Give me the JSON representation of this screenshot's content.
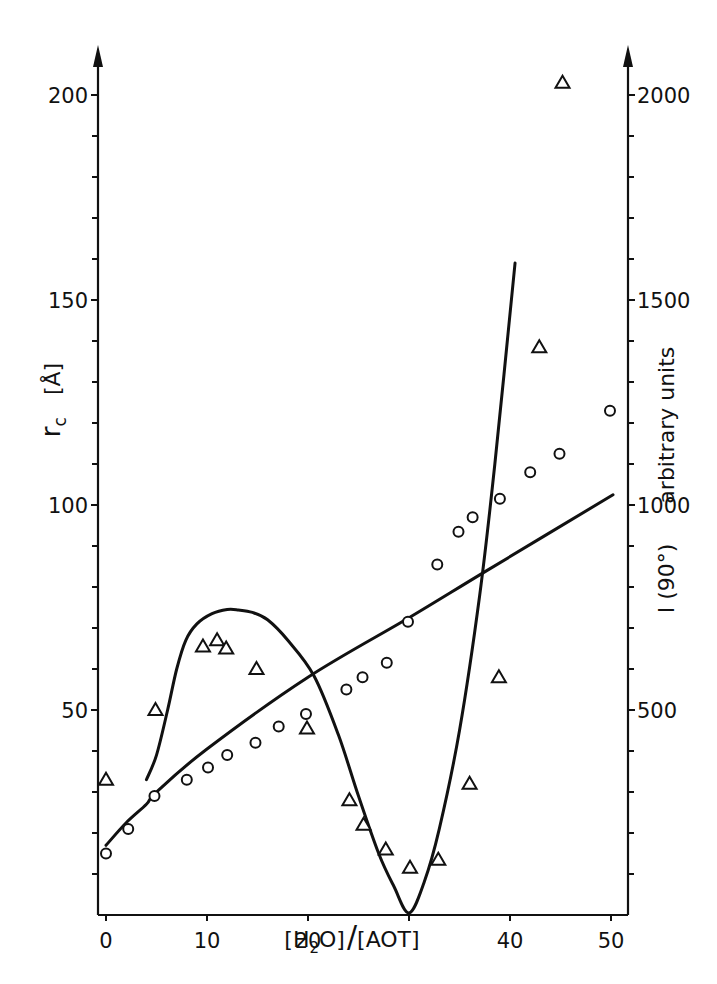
{
  "chart_data": {
    "type": "scatter",
    "title": "",
    "xlabel": "[H2O]/[AOT]",
    "xlabel_parts": {
      "open1": "[H",
      "sub": "2",
      "close1": "O]",
      "slash": "/",
      "second": "[AOT]"
    },
    "ylabel_left": "r_c [Å]",
    "ylabel_left_parts": {
      "symbol": "r",
      "sub": "c",
      "unit": "[Å]"
    },
    "ylabel_right": "I (90°) arbitrary units",
    "ylabel_right_parts": {
      "symbol": "I (90°)",
      "unit": "arbitrary units"
    },
    "xlim": [
      0,
      52
    ],
    "ylim_left": [
      0,
      210
    ],
    "ylim_right": [
      0,
      2100
    ],
    "grid": false,
    "legend": "none",
    "x_ticks": [
      0,
      10,
      20,
      30,
      40,
      50
    ],
    "x_tick_labels": [
      "0",
      "10",
      "20",
      "",
      "40",
      "50"
    ],
    "y_left_ticks_major": [
      50,
      100,
      150,
      200
    ],
    "y_left_tick_labels": [
      "50",
      "100",
      "150",
      "200"
    ],
    "y_left_ticks_minor": [
      10,
      20,
      30,
      40,
      60,
      70,
      80,
      90,
      110,
      120,
      130,
      140,
      160,
      170,
      180,
      190
    ],
    "y_right_ticks_major": [
      500,
      1000,
      1500,
      2000
    ],
    "y_right_tick_labels": [
      "500",
      "1000",
      "1500",
      "2000"
    ],
    "y_right_ticks_minor": [
      100,
      200,
      300,
      400,
      600,
      700,
      800,
      900,
      1100,
      1200,
      1300,
      1400,
      1600,
      1700,
      1800,
      1900
    ],
    "series": [
      {
        "name": "r_c (circles)",
        "marker": "circle",
        "axis": "left",
        "x": [
          0,
          2.2,
          4.8,
          8.0,
          10.1,
          12.0,
          14.8,
          17.1,
          19.8,
          23.8,
          25.4,
          27.8,
          29.9,
          32.8,
          34.9,
          36.3,
          39.0,
          42.0,
          44.9,
          49.9
        ],
        "y": [
          15,
          21,
          29,
          33,
          36,
          39,
          42,
          46,
          49,
          55,
          58,
          61.5,
          71.5,
          85.5,
          93.5,
          97,
          101.5,
          108,
          112.5,
          123
        ]
      },
      {
        "name": "I(90°) (triangles)",
        "marker": "triangle",
        "axis": "right",
        "x": [
          0,
          4.9,
          9.6,
          11.0,
          11.9,
          14.9,
          19.9,
          24.1,
          25.5,
          27.7,
          30.1,
          32.9,
          36.0,
          38.9,
          42.9,
          45.2
        ],
        "y": [
          330,
          500,
          655,
          670,
          650,
          600,
          455,
          280,
          220,
          160,
          115,
          135,
          320,
          580,
          1385,
          2030
        ]
      },
      {
        "name": "linear fit (r_c)",
        "type": "line",
        "axis": "left",
        "x": [
          0,
          2,
          4,
          5,
          10,
          20,
          30,
          37.7,
          50.2
        ],
        "y": [
          17,
          22.5,
          27,
          30,
          40.5,
          58,
          72.5,
          84,
          102.5
        ]
      },
      {
        "name": "intensity curve",
        "type": "line",
        "axis": "right",
        "x": [
          4.0,
          5.0,
          6.1,
          7.0,
          7.9,
          9.0,
          10.5,
          12.0,
          13.1,
          14.5,
          16.0,
          18.0,
          20.6,
          23.0,
          25.0,
          27.0,
          28.5,
          30.0,
          31.5,
          33.0,
          35.0,
          37.0,
          38.5,
          40.5
        ],
        "y": [
          330,
          390,
          500,
          600,
          670,
          710,
          735,
          745,
          744,
          738,
          720,
          670,
          583,
          440,
          290,
          150,
          70,
          5,
          80,
          210,
          450,
          780,
          1100,
          1590
        ]
      }
    ]
  }
}
